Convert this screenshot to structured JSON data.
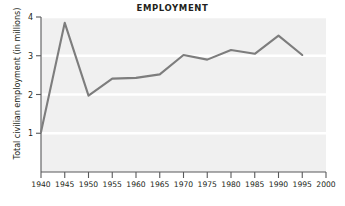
{
  "chart_data": {
    "type": "line",
    "title": "EMPLOYMENT",
    "xlabel": "",
    "ylabel": "Total civilian employment (in millions)",
    "x": [
      1940,
      1945,
      1950,
      1955,
      1960,
      1965,
      1970,
      1975,
      1980,
      1985,
      1990,
      1995
    ],
    "values": [
      1.03,
      3.85,
      1.97,
      2.41,
      2.43,
      2.52,
      3.02,
      2.9,
      3.15,
      3.05,
      3.52,
      3.02
    ],
    "series": [
      {
        "name": "Total civilian employment",
        "values": [
          1.03,
          3.85,
          1.97,
          2.41,
          2.43,
          2.52,
          3.02,
          2.9,
          3.15,
          3.05,
          3.52,
          3.02
        ]
      }
    ],
    "xlim": [
      1940,
      2000
    ],
    "ylim": [
      0,
      4
    ],
    "xticks": [
      1940,
      1945,
      1950,
      1955,
      1960,
      1965,
      1970,
      1975,
      1980,
      1985,
      1990,
      1995,
      2000
    ],
    "xtick_labels": [
      "1940",
      "1945",
      "1950",
      "1955",
      "1960",
      "1965",
      "1970",
      "1975",
      "1980",
      "1985",
      "1990",
      "1995",
      "2000"
    ],
    "yticks": [
      1,
      2,
      3,
      4
    ],
    "ytick_labels": [
      "1",
      "2",
      "3",
      "4"
    ],
    "grid": "horizontal",
    "legend": "none",
    "colors": {
      "line": "#7d7d7d",
      "plot_background": "#f0f0f0",
      "gridline": "#ffffff",
      "axis": "#58595b",
      "text": "#231f20",
      "page_background": "#ffffff"
    }
  }
}
